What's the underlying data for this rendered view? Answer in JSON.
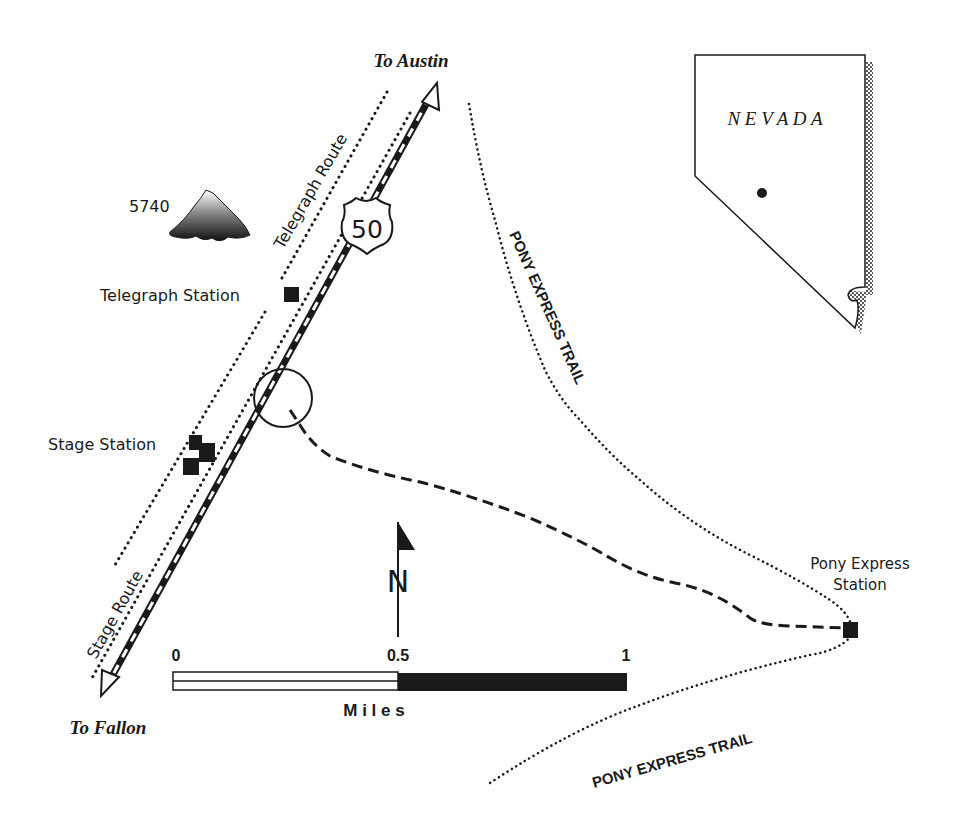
{
  "map": {
    "destinations": {
      "north": "To Austin",
      "south": "To Fallon"
    },
    "highway": {
      "shield_number": "50"
    },
    "routes": {
      "telegraph": "Telegraph Route",
      "stage": "Stage Route",
      "pony_trail_north": "PONY EXPRESS TRAIL",
      "pony_trail_south": "PONY EXPRESS TRAIL"
    },
    "features": {
      "peak_elevation": "5740",
      "telegraph_station": "Telegraph Station",
      "stage_station": "Stage Station",
      "pony_station_line1": "Pony Express",
      "pony_station_line2": "Station"
    },
    "north_arrow": {
      "label": "N"
    },
    "scale_bar": {
      "tick_0": "0",
      "tick_mid": "0.5",
      "tick_end": "1",
      "unit": "M i l e s"
    },
    "inset": {
      "state": "N E V A D A"
    }
  },
  "colors": {
    "ink": "#1a1a1a",
    "paper": "#ffffff"
  }
}
